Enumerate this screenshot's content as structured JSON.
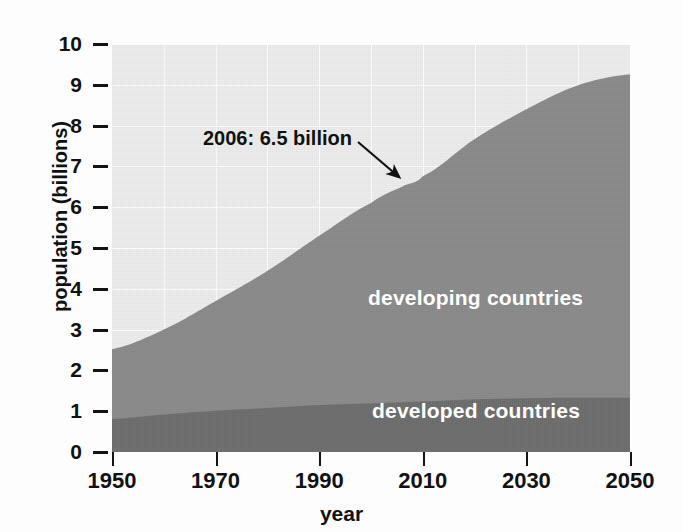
{
  "chart_data": {
    "type": "area",
    "title": "",
    "subtitle": "",
    "xlabel": "year",
    "ylabel": "population (billions)",
    "xlim": [
      1950,
      2050
    ],
    "ylim": [
      0,
      10
    ],
    "grid": true,
    "stacked": true,
    "legend_position": "in-plot",
    "x_ticks": [
      1950,
      1970,
      1990,
      2010,
      2030,
      2050
    ],
    "x_tick_labels": [
      "1950",
      "1970",
      "1990",
      "2010",
      "2030",
      "2050"
    ],
    "y_ticks": [
      0,
      1,
      2,
      3,
      4,
      5,
      6,
      7,
      8,
      9,
      10
    ],
    "y_tick_labels": [
      "0",
      "1",
      "2",
      "3",
      "4",
      "5",
      "6",
      "7",
      "8",
      "9",
      "10"
    ],
    "x": [
      1950,
      1960,
      1970,
      1980,
      1990,
      2000,
      2006,
      2010,
      2020,
      2030,
      2040,
      2050
    ],
    "series": [
      {
        "name": "developed countries",
        "color": "#6e6e6e",
        "values": [
          0.81,
          0.92,
          1.01,
          1.08,
          1.15,
          1.19,
          1.22,
          1.24,
          1.29,
          1.32,
          1.33,
          1.33
        ]
      },
      {
        "name": "developing countries",
        "color": "#8b8b8b",
        "values": [
          1.71,
          2.08,
          2.69,
          3.36,
          4.15,
          4.91,
          5.28,
          5.52,
          6.38,
          7.08,
          7.66,
          7.93
        ]
      }
    ],
    "totals": [
      2.52,
      3.0,
      3.7,
      4.44,
      5.3,
      6.1,
      6.5,
      6.76,
      7.67,
      8.4,
      8.99,
      9.26
    ],
    "annotations": [
      {
        "text": "2006: 6.5 billion",
        "point_x": 2006,
        "point_y": 6.5,
        "arrow": true
      }
    ],
    "colors": {
      "plot_background": "#ededed",
      "gridline": "#ffffff",
      "developed": "#6e6e6e",
      "developing": "#8b8b8b",
      "text": "#111111",
      "label_text": "#ffffff"
    }
  },
  "axes": {
    "y_title": "population (billions)",
    "x_title": "year"
  }
}
